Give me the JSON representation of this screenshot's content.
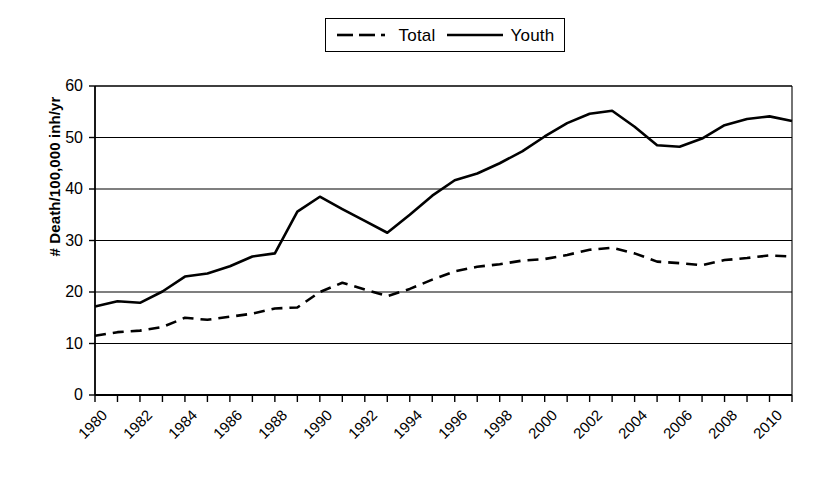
{
  "chart_data": {
    "type": "line",
    "title": "",
    "subtitle": "",
    "xlabel": "",
    "ylabel": "# Death/100,000 inh/yr",
    "xlim": [
      1980,
      2011
    ],
    "ylim": [
      0,
      60
    ],
    "y_ticks": [
      0,
      10,
      20,
      30,
      40,
      50,
      60
    ],
    "x_ticks": [
      1980,
      1981,
      1982,
      1983,
      1984,
      1985,
      1986,
      1987,
      1988,
      1989,
      1990,
      1991,
      1992,
      1993,
      1994,
      1995,
      1996,
      1997,
      1998,
      1999,
      2000,
      2001,
      2002,
      2003,
      2004,
      2005,
      2006,
      2007,
      2008,
      2009,
      2010,
      2011
    ],
    "x_tick_labels": [
      "1980",
      "1982",
      "1984",
      "1986",
      "1988",
      "1990",
      "1992",
      "1994",
      "1996",
      "1998",
      "2000",
      "2002",
      "2004",
      "2006",
      "2008",
      "2010"
    ],
    "x_tick_label_years": [
      1980,
      1982,
      1984,
      1986,
      1988,
      1990,
      1992,
      1994,
      1996,
      1998,
      2000,
      2002,
      2004,
      2006,
      2008,
      2010
    ],
    "grid": "horizontal",
    "legend_position": "top-center",
    "x": [
      1980,
      1981,
      1982,
      1983,
      1984,
      1985,
      1986,
      1987,
      1988,
      1989,
      1990,
      1991,
      1992,
      1993,
      1994,
      1995,
      1996,
      1997,
      1998,
      1999,
      2000,
      2001,
      2002,
      2003,
      2004,
      2005,
      2006,
      2007,
      2008,
      2009,
      2010,
      2011
    ],
    "series": [
      {
        "name": "Total",
        "style": "dashed",
        "color": "#000000",
        "values": [
          11.5,
          12.2,
          12.5,
          13.2,
          15.0,
          14.6,
          15.2,
          15.8,
          16.8,
          17.0,
          20.0,
          21.8,
          20.5,
          19.2,
          20.6,
          22.4,
          24.0,
          24.9,
          25.4,
          26.1,
          26.4,
          27.2,
          28.2,
          28.6,
          27.5,
          25.9,
          25.6,
          25.2,
          26.2,
          26.6,
          27.1,
          26.9
        ]
      },
      {
        "name": "Youth",
        "style": "solid",
        "color": "#000000",
        "values": [
          17.2,
          18.2,
          17.9,
          20.1,
          23.0,
          23.6,
          25.0,
          26.9,
          27.5,
          35.6,
          38.5,
          36.1,
          33.8,
          31.5,
          35.0,
          38.7,
          41.7,
          43.0,
          45.0,
          47.3,
          50.2,
          52.8,
          54.6,
          55.2,
          52.1,
          48.5,
          48.2,
          49.8,
          52.4,
          53.6,
          54.1,
          53.2
        ]
      }
    ]
  },
  "legend": {
    "items": [
      {
        "label": "Total",
        "style": "dashed"
      },
      {
        "label": "Youth",
        "style": "solid"
      }
    ]
  },
  "axes": {
    "y_title": "# Death/100,000 inh/yr"
  }
}
